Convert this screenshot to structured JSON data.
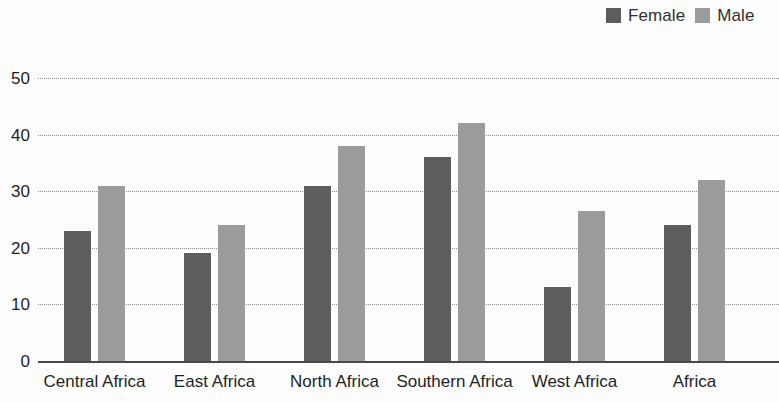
{
  "legend": {
    "position": "top-right",
    "entries": [
      {
        "label": "Female",
        "color": "#5d5d5d",
        "swatch_name": "legend-swatch-female"
      },
      {
        "label": "Male",
        "color": "#9b9b9b",
        "swatch_name": "legend-swatch-male"
      }
    ]
  },
  "axis": {
    "y_ticks": [
      "0",
      "10",
      "20",
      "30",
      "40",
      "50"
    ]
  },
  "chart_data": {
    "type": "bar",
    "title": "",
    "subtitle": "",
    "xlabel": "",
    "ylabel": "",
    "ylim": [
      0,
      50
    ],
    "yticks": [
      0,
      10,
      20,
      30,
      40,
      50
    ],
    "grid": true,
    "grid_style": "dotted horizontal",
    "legend_position": "top-right",
    "categories": [
      "Central Africa",
      "East Africa",
      "North Africa",
      "Southern Africa",
      "West Africa",
      "Africa"
    ],
    "series": [
      {
        "name": "Female",
        "color": "#5d5d5d",
        "values": [
          23,
          19,
          31,
          36,
          13,
          24
        ]
      },
      {
        "name": "Male",
        "color": "#9b9b9b",
        "values": [
          31,
          24,
          38,
          42,
          26.5,
          32
        ]
      }
    ]
  }
}
